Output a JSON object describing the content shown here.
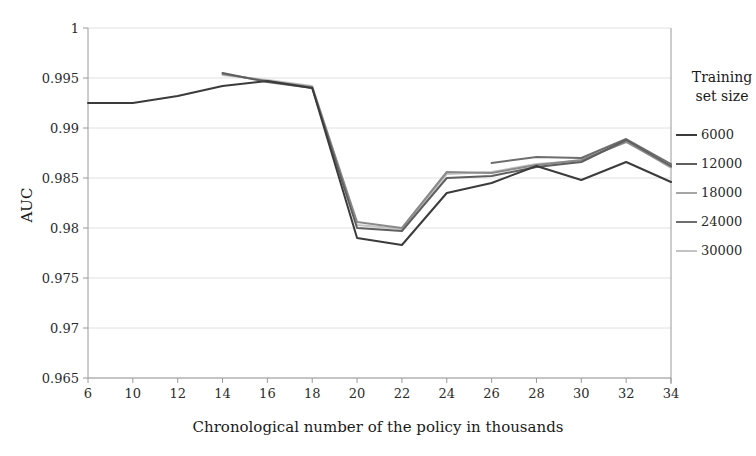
{
  "chart_data": {
    "type": "line",
    "title": "",
    "xlabel": "Chronological number of the policy in thousands",
    "ylabel": "AUC",
    "categories": [
      6,
      10,
      12,
      14,
      16,
      18,
      20,
      22,
      24,
      26,
      28,
      30,
      32,
      34
    ],
    "xtick_labels": [
      "6",
      "10",
      "12",
      "14",
      "16",
      "18",
      "20",
      "22",
      "24",
      "26",
      "28",
      "30",
      "32",
      "34"
    ],
    "ytick_labels": [
      "0.965",
      "0.97",
      "0.975",
      "0.98",
      "0.985",
      "0.99",
      "0.995",
      "1"
    ],
    "ytick_values": [
      0.965,
      0.97,
      0.975,
      0.98,
      0.985,
      0.99,
      0.995,
      1
    ],
    "ylim": [
      0.965,
      1.0
    ],
    "grid": true,
    "grid_axis": "y",
    "legend_position": "right",
    "legend_title_lines": [
      "Training",
      "set size"
    ],
    "series": [
      {
        "name": "6000",
        "color": "#3b3b3b",
        "values": [
          0.9925,
          0.9925,
          0.9932,
          0.9942,
          0.9947,
          0.994,
          0.979,
          0.9783,
          0.9835,
          0.9845,
          0.9862,
          0.9848,
          0.9866,
          0.9846
        ]
      },
      {
        "name": "12000",
        "color": "#5f5f5f",
        "values": [
          null,
          null,
          null,
          0.9955,
          0.9946,
          0.994,
          0.98,
          0.9797,
          0.985,
          0.9852,
          0.9861,
          0.9866,
          0.9888,
          0.9862
        ]
      },
      {
        "name": "18000",
        "color": "#8a8a8a",
        "values": [
          null,
          null,
          null,
          0.9954,
          0.9947,
          0.9941,
          0.9806,
          0.98,
          0.9856,
          0.9855,
          0.9863,
          0.9868,
          0.9886,
          0.9861
        ]
      },
      {
        "name": "24000",
        "color": "#6e6e6e",
        "values": [
          null,
          null,
          null,
          null,
          null,
          null,
          null,
          null,
          null,
          0.9865,
          0.9871,
          0.987,
          0.9889,
          0.9864
        ]
      },
      {
        "name": "30000",
        "color": "#c3c3c3",
        "values": [
          null,
          null,
          null,
          0.9953,
          0.9948,
          0.9942,
          0.9803,
          0.9799,
          0.9854,
          0.9856,
          0.9864,
          0.9867,
          0.9887,
          0.986
        ]
      }
    ]
  },
  "legend": {
    "title_line_1": "Training",
    "title_line_2": "set size",
    "items": [
      {
        "label": "6000",
        "color": "#3b3b3b"
      },
      {
        "label": "12000",
        "color": "#5f5f5f"
      },
      {
        "label": "18000",
        "color": "#a5a5a5"
      },
      {
        "label": "24000",
        "color": "#6e6e6e"
      },
      {
        "label": "30000",
        "color": "#c3c3c3"
      }
    ]
  },
  "axes": {
    "x_title": "Chronological number of the policy in thousands",
    "y_title": "AUC"
  },
  "style": {
    "grid_color": "#d8d8d8",
    "axis_color": "#9a9a9a",
    "background": "#ffffff"
  }
}
